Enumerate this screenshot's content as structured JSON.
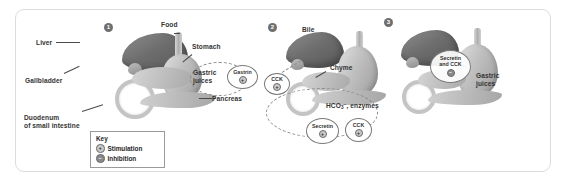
{
  "figure": {
    "type": "three-panel biology diagram"
  },
  "key": {
    "title": "Key",
    "items": [
      {
        "symbol": "+",
        "label": "Stimulation"
      },
      {
        "symbol": "−",
        "label": "Inhibition"
      }
    ]
  },
  "panels": [
    {
      "number": "1",
      "labels": [
        {
          "name": "liver-label",
          "text": "Liver"
        },
        {
          "name": "gallbladder-label",
          "text": "Gallbladder"
        },
        {
          "name": "duodenum-label",
          "text": "Duodenum\nof small intestine"
        },
        {
          "name": "food-label",
          "text": "Food"
        },
        {
          "name": "stomach-label",
          "text": "Stomach"
        },
        {
          "name": "gastric-juices-label",
          "text": "Gastric\njuices"
        },
        {
          "name": "pancreas-label",
          "text": "Pancreas"
        }
      ],
      "bubbles": [
        {
          "name": "gastrin-bubble",
          "text": "Gastrin",
          "sign": "+"
        }
      ]
    },
    {
      "number": "2",
      "labels": [
        {
          "name": "bile-label",
          "text": "Bile"
        },
        {
          "name": "chyme-label",
          "text": "Chyme"
        },
        {
          "name": "secretions-label",
          "text": "HCO3- , enzymes"
        }
      ],
      "bubbles": [
        {
          "name": "cck-bubble-upper",
          "text": "CCK",
          "sign": "+"
        },
        {
          "name": "secretin-bubble",
          "text": "Secretin",
          "sign": "+"
        },
        {
          "name": "cck-bubble-lower",
          "text": "CCK",
          "sign": "+"
        }
      ]
    },
    {
      "number": "3",
      "labels": [
        {
          "name": "gastric-juices-label-3",
          "text": "Gastric\njuices"
        }
      ],
      "bubbles": [
        {
          "name": "secretin-cck-bubble",
          "text": "Secretin\nand CCK",
          "sign": "−"
        }
      ]
    }
  ],
  "colors": {
    "frame_border": "#dcdcdc",
    "marker_fill": "#6f6f6f",
    "bubble_stroke": "#7a7a7a",
    "dash_stroke": "#8d8d8d",
    "stimulation_fill": "#c9c9c9",
    "inhibition_fill": "#8a8a8a",
    "text": "#333333"
  }
}
